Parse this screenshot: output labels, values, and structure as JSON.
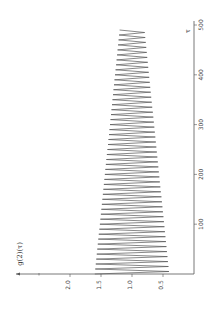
{
  "chart_data": {
    "type": "line",
    "title": "",
    "xlabel": "τ",
    "ylabel": "g(2)(τ)",
    "orientation": "rotated-90-ccw",
    "xlim": [
      0,
      500
    ],
    "ylim": [
      0,
      2.5
    ],
    "x_ticks": [
      100,
      200,
      300,
      400,
      500
    ],
    "x_tick_labels": [
      "100",
      "200",
      "300",
      "400",
      "500"
    ],
    "y_ticks": [
      0.5,
      1.0,
      1.5,
      2.0
    ],
    "y_tick_labels": [
      "0.5",
      "1.0",
      "1.5",
      "2.0"
    ],
    "grid": false,
    "legend": "none",
    "series": [
      {
        "name": "g(2)(τ)",
        "description": "damped oscillation around 1.0, period ~10, amplitude decaying from ~0.6 at τ=0 to ~0.2 at τ≈490",
        "x_start": 0,
        "x_end": 490,
        "period": 10,
        "center": 1.0,
        "amplitude_start": 0.6,
        "amplitude_end": 0.2,
        "initial_value": 1.6
      }
    ]
  }
}
